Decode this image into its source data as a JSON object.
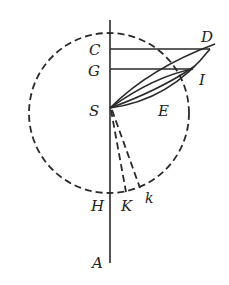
{
  "diagram": {
    "colors": {
      "ink": "#2a2a2a",
      "background": "#ffffff"
    },
    "labels": {
      "C": "C",
      "D": "D",
      "G": "G",
      "I": "I",
      "S": "S",
      "E": "E",
      "H": "H",
      "K": "K",
      "k": "k",
      "A": "A"
    }
  }
}
